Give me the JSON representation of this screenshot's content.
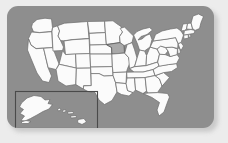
{
  "panel": {
    "background_color": "#8e8e8e",
    "outer_background_color": "#ececec",
    "corner_radius_px": 11
  },
  "map": {
    "title": "United States map",
    "projection_note": "contiguous states with Alaska and Hawaii inset",
    "state_fill_color": "#fbfbfb",
    "state_border_color": "#6d6d6d",
    "highlight_fill_color": "#a9a9a9",
    "highlighted_states": [
      "Iowa"
    ],
    "inset": {
      "label": "Alaska and Hawaii inset",
      "border_color": "#4a4a4a",
      "states": [
        "Alaska",
        "Hawaii"
      ]
    },
    "states": [
      {
        "id": "WA",
        "name": "Washington",
        "highlighted": false
      },
      {
        "id": "OR",
        "name": "Oregon",
        "highlighted": false
      },
      {
        "id": "CA",
        "name": "California",
        "highlighted": false
      },
      {
        "id": "NV",
        "name": "Nevada",
        "highlighted": false
      },
      {
        "id": "ID",
        "name": "Idaho",
        "highlighted": false
      },
      {
        "id": "MT",
        "name": "Montana",
        "highlighted": false
      },
      {
        "id": "WY",
        "name": "Wyoming",
        "highlighted": false
      },
      {
        "id": "UT",
        "name": "Utah",
        "highlighted": false
      },
      {
        "id": "AZ",
        "name": "Arizona",
        "highlighted": false
      },
      {
        "id": "CO",
        "name": "Colorado",
        "highlighted": false
      },
      {
        "id": "NM",
        "name": "New Mexico",
        "highlighted": false
      },
      {
        "id": "ND",
        "name": "North Dakota",
        "highlighted": false
      },
      {
        "id": "SD",
        "name": "South Dakota",
        "highlighted": false
      },
      {
        "id": "NE",
        "name": "Nebraska",
        "highlighted": false
      },
      {
        "id": "KS",
        "name": "Kansas",
        "highlighted": false
      },
      {
        "id": "OK",
        "name": "Oklahoma",
        "highlighted": false
      },
      {
        "id": "TX",
        "name": "Texas",
        "highlighted": false
      },
      {
        "id": "MN",
        "name": "Minnesota",
        "highlighted": false
      },
      {
        "id": "IA",
        "name": "Iowa",
        "highlighted": true
      },
      {
        "id": "MO",
        "name": "Missouri",
        "highlighted": false
      },
      {
        "id": "AR",
        "name": "Arkansas",
        "highlighted": false
      },
      {
        "id": "LA",
        "name": "Louisiana",
        "highlighted": false
      },
      {
        "id": "WI",
        "name": "Wisconsin",
        "highlighted": false
      },
      {
        "id": "IL",
        "name": "Illinois",
        "highlighted": false
      },
      {
        "id": "MI",
        "name": "Michigan",
        "highlighted": false
      },
      {
        "id": "IN",
        "name": "Indiana",
        "highlighted": false
      },
      {
        "id": "OH",
        "name": "Ohio",
        "highlighted": false
      },
      {
        "id": "KY",
        "name": "Kentucky",
        "highlighted": false
      },
      {
        "id": "TN",
        "name": "Tennessee",
        "highlighted": false
      },
      {
        "id": "MS",
        "name": "Mississippi",
        "highlighted": false
      },
      {
        "id": "AL",
        "name": "Alabama",
        "highlighted": false
      },
      {
        "id": "GA",
        "name": "Georgia",
        "highlighted": false
      },
      {
        "id": "FL",
        "name": "Florida",
        "highlighted": false
      },
      {
        "id": "SC",
        "name": "South Carolina",
        "highlighted": false
      },
      {
        "id": "NC",
        "name": "North Carolina",
        "highlighted": false
      },
      {
        "id": "VA",
        "name": "Virginia",
        "highlighted": false
      },
      {
        "id": "WV",
        "name": "West Virginia",
        "highlighted": false
      },
      {
        "id": "MD",
        "name": "Maryland",
        "highlighted": false
      },
      {
        "id": "DE",
        "name": "Delaware",
        "highlighted": false
      },
      {
        "id": "PA",
        "name": "Pennsylvania",
        "highlighted": false
      },
      {
        "id": "NJ",
        "name": "New Jersey",
        "highlighted": false
      },
      {
        "id": "NY",
        "name": "New York",
        "highlighted": false
      },
      {
        "id": "CT",
        "name": "Connecticut",
        "highlighted": false
      },
      {
        "id": "RI",
        "name": "Rhode Island",
        "highlighted": false
      },
      {
        "id": "MA",
        "name": "Massachusetts",
        "highlighted": false
      },
      {
        "id": "VT",
        "name": "Vermont",
        "highlighted": false
      },
      {
        "id": "NH",
        "name": "New Hampshire",
        "highlighted": false
      },
      {
        "id": "ME",
        "name": "Maine",
        "highlighted": false
      },
      {
        "id": "AK",
        "name": "Alaska",
        "highlighted": false
      },
      {
        "id": "HI",
        "name": "Hawaii",
        "highlighted": false
      }
    ]
  }
}
